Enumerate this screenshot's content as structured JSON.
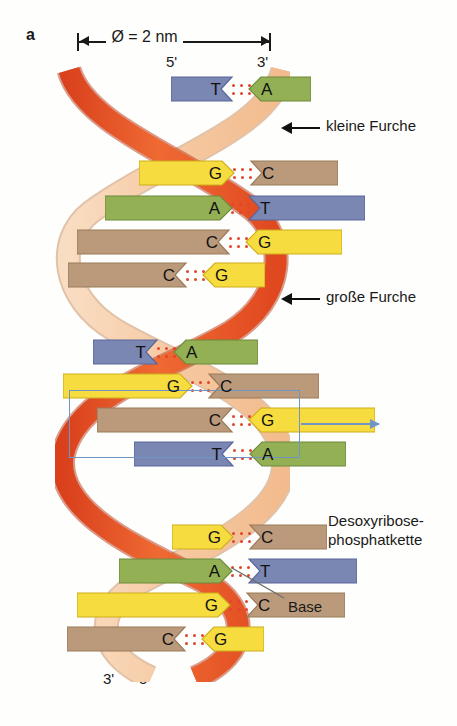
{
  "figure": {
    "panel_letter": "a",
    "dimension_label": "Ø = 2 nm",
    "primes": {
      "top_left": "5'",
      "top_right": "3'",
      "bottom_left": "3'",
      "bottom_right": "5'"
    },
    "annotations": {
      "minor_groove": "kleine Furche",
      "major_groove": "große Furche",
      "backbone": "Desoxyribose-\nphosphatkette",
      "backbone_line1": "Desoxyribose-",
      "backbone_line2": "phosphatkette",
      "base": "Base"
    },
    "colors": {
      "strand_front": "#e8552a",
      "strand_back": "#f6cba6",
      "base_A": "#93b055",
      "base_T": "#7b87b3",
      "base_G": "#f6dc3e",
      "base_C": "#bb9a7c",
      "hydrogen_bond": "#e2452a",
      "highlight_box": "#6e95c4",
      "background": "#fefefc"
    },
    "base_pairs": [
      {
        "left": "T",
        "right": "A",
        "y": 14,
        "left_x": 116,
        "left_w": 63,
        "right_x": 124,
        "right_w": 63,
        "highlighted": false
      },
      {
        "left": "G",
        "right": "C",
        "y": 98,
        "left_x": 84,
        "left_w": 96,
        "right_x": 125,
        "right_w": 89,
        "highlighted": false
      },
      {
        "left": "A",
        "right": "T",
        "y": 133,
        "left_x": 50,
        "left_w": 128,
        "right_x": 124,
        "right_w": 118,
        "highlighted": false
      },
      {
        "left": "C",
        "right": "G",
        "y": 167,
        "left_x": 22,
        "left_w": 154,
        "right_x": 122,
        "right_w": 97,
        "highlighted": false
      },
      {
        "left": "C",
        "right": "G",
        "y": 200,
        "left_x": 13,
        "left_w": 120,
        "right_x": 98,
        "right_w": 63,
        "highlighted": false
      },
      {
        "left": "T",
        "right": "A",
        "y": 277,
        "left_x": 38,
        "left_w": 66,
        "right_x": 50,
        "right_w": 85,
        "highlighted": false
      },
      {
        "left": "G",
        "right": "C",
        "y": 311,
        "left_x": 8,
        "left_w": 130,
        "right_x": 84,
        "right_w": 112,
        "highlighted": false
      },
      {
        "left": "C",
        "right": "G",
        "y": 345,
        "left_x": 42,
        "left_w": 137,
        "right_x": 124,
        "right_w": 127,
        "highlighted": true
      },
      {
        "left": "T",
        "right": "A",
        "y": 379,
        "left_x": 79,
        "left_w": 101,
        "right_x": 125,
        "right_w": 97,
        "highlighted": true
      },
      {
        "left": "G",
        "right": "C",
        "y": 462,
        "left_x": 117,
        "left_w": 62,
        "right_x": 124,
        "right_w": 79,
        "highlighted": false
      },
      {
        "left": "A",
        "right": "T",
        "y": 496,
        "left_x": 64,
        "left_w": 114,
        "right_x": 124,
        "right_w": 110,
        "highlighted": false
      },
      {
        "left": "G",
        "right": "C",
        "y": 530,
        "left_x": 22,
        "left_w": 154,
        "right_x": 122,
        "right_w": 100,
        "highlighted": false
      },
      {
        "left": "C",
        "right": "G",
        "y": 564,
        "left_x": 12,
        "left_w": 120,
        "right_x": 98,
        "right_w": 63,
        "highlighted": false
      }
    ]
  }
}
